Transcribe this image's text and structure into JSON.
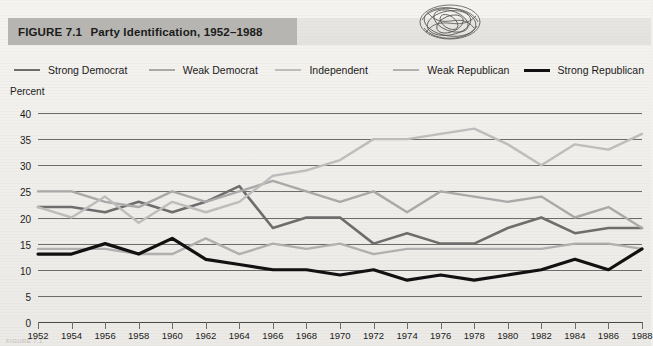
{
  "figure": {
    "label": "FIGURE 7.1",
    "title": "Party Identification, 1952–1988",
    "title_bar_color": "#b6b5b1"
  },
  "axes": {
    "y_axis_label": "Percent",
    "y_ticks": [
      "40",
      "35",
      "30",
      "25",
      "20",
      "15",
      "10",
      "5",
      "0"
    ],
    "y_min": 0,
    "y_max": 40,
    "y_step": 5,
    "x_ticks": [
      "1952",
      "1954",
      "1956",
      "1958",
      "1960",
      "1962",
      "1964",
      "1966",
      "1968",
      "1970",
      "1972",
      "1974",
      "1976",
      "1978",
      "1980",
      "1982",
      "1984",
      "1986",
      "1988"
    ],
    "gridlines": true
  },
  "legend": {
    "position": "top",
    "items": [
      {
        "label": "Strong Democrat",
        "color": "#6d6d6d",
        "width": 2.6
      },
      {
        "label": "Weak Democrat",
        "color": "#a9a9a9",
        "width": 2.4
      },
      {
        "label": "Independent",
        "color": "#bdbdbd",
        "width": 2.4
      },
      {
        "label": "Weak Republican",
        "color": "#b0b0b0",
        "width": 2.4
      },
      {
        "label": "Strong Republican",
        "color": "#111111",
        "width": 3.2
      }
    ]
  },
  "artifacts": {
    "scribble": "pen-scribble-mark",
    "footnote": "FIGURE 7.1"
  },
  "chart_data": {
    "type": "line",
    "title": "Party Identification, 1952–1988",
    "xlabel": "",
    "ylabel": "Percent",
    "ylim": [
      0,
      40
    ],
    "xlim": [
      "1952",
      "1988"
    ],
    "grid": true,
    "legend_position": "top",
    "categories": [
      "1952",
      "1954",
      "1956",
      "1958",
      "1960",
      "1962",
      "1964",
      "1966",
      "1968",
      "1970",
      "1972",
      "1974",
      "1976",
      "1978",
      "1980",
      "1982",
      "1984",
      "1986",
      "1988"
    ],
    "series": [
      {
        "name": "Strong Democrat",
        "color": "#6d6d6d",
        "values": [
          22,
          22,
          21,
          23,
          21,
          23,
          26,
          18,
          20,
          20,
          15,
          17,
          15,
          15,
          18,
          20,
          17,
          18,
          18
        ]
      },
      {
        "name": "Weak Democrat",
        "color": "#a9a9a9",
        "values": [
          25,
          25,
          23,
          22,
          25,
          23,
          25,
          27,
          25,
          23,
          25,
          21,
          25,
          24,
          23,
          24,
          20,
          22,
          18
        ]
      },
      {
        "name": "Independent",
        "color": "#bdbdbd",
        "values": [
          22,
          20,
          24,
          19,
          23,
          21,
          23,
          28,
          29,
          31,
          35,
          35,
          36,
          37,
          34,
          30,
          34,
          33,
          36
        ]
      },
      {
        "name": "Weak Republican",
        "color": "#b0b0b0",
        "values": [
          14,
          14,
          14,
          13,
          13,
          16,
          13,
          15,
          14,
          15,
          13,
          14,
          14,
          14,
          14,
          14,
          15,
          15,
          14
        ]
      },
      {
        "name": "Strong Republican",
        "color": "#111111",
        "values": [
          13,
          13,
          15,
          13,
          16,
          12,
          11,
          10,
          10,
          9,
          10,
          8,
          9,
          8,
          9,
          10,
          12,
          10,
          14
        ]
      }
    ]
  }
}
